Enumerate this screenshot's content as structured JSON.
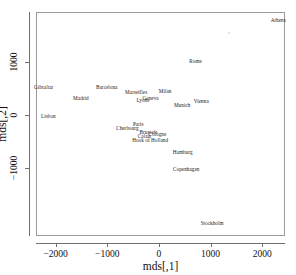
{
  "chart_data": {
    "type": "scatter",
    "title": "",
    "xlabel": "mds[,1]",
    "ylabel": "mds[,2]",
    "xlim": [
      -2380,
      2440
    ],
    "ylim": [
      -2300,
      1960
    ],
    "xticks": [
      -2000,
      -1000,
      0,
      1000,
      2000
    ],
    "xticklabels": [
      "−2000",
      "−1000",
      "0",
      "1000",
      "2000"
    ],
    "yticks": [
      1000,
      0,
      -1000
    ],
    "yticklabels": [
      "1000",
      "0",
      "−1000"
    ],
    "grid": false,
    "legend": false,
    "marker": "text-labels",
    "points": [
      {
        "label": "Athens",
        "x": 2290,
        "y": 1800
      },
      {
        "label": "Rome",
        "x": 690,
        "y": 1035
      },
      {
        "label": "Gibraltar",
        "x": -2250,
        "y": 540
      },
      {
        "label": "Barcelona",
        "x": -1030,
        "y": 525
      },
      {
        "label": "Madrid",
        "x": -1530,
        "y": 325
      },
      {
        "label": "Marseilles",
        "x": -460,
        "y": 430
      },
      {
        "label": "Milan",
        "x": 100,
        "y": 450
      },
      {
        "label": "Lyons",
        "x": -330,
        "y": 290
      },
      {
        "label": "Geneva",
        "x": -180,
        "y": 315
      },
      {
        "label": "Vienna",
        "x": 800,
        "y": 275
      },
      {
        "label": "Munich",
        "x": 430,
        "y": 185
      },
      {
        "label": "Lisbon",
        "x": -2160,
        "y": -20
      },
      {
        "label": "Paris",
        "x": -420,
        "y": -170
      },
      {
        "label": "Cherbourg",
        "x": -630,
        "y": -250
      },
      {
        "label": "Brussels",
        "x": -220,
        "y": -330
      },
      {
        "label": "Cologne",
        "x": -50,
        "y": -360
      },
      {
        "label": "Calais",
        "x": -300,
        "y": -390
      },
      {
        "label": "Hook of Holland",
        "x": -190,
        "y": -480
      },
      {
        "label": "Hamburg",
        "x": 440,
        "y": -710
      },
      {
        "label": "Copenhagen",
        "x": 510,
        "y": -1030
      },
      {
        "label": "Stockholm",
        "x": 1010,
        "y": -2060
      }
    ],
    "stray_marks": [
      {
        "x": 1330,
        "y": 1580
      }
    ]
  }
}
